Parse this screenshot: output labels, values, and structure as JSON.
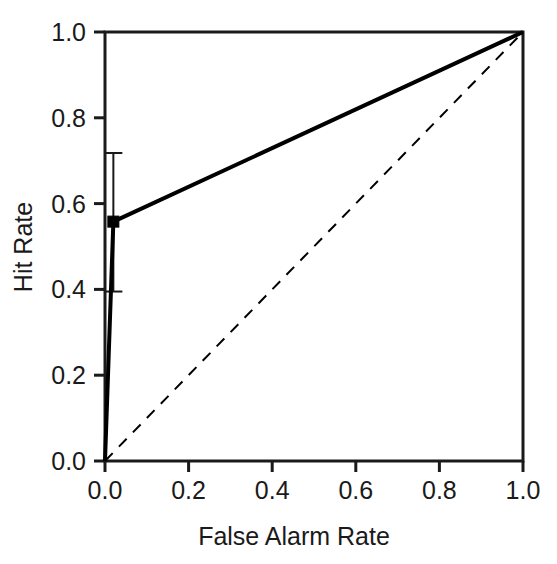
{
  "chart_data": {
    "type": "line",
    "title": "",
    "xlabel": "False Alarm Rate",
    "ylabel": "Hit Rate",
    "xlim": [
      0.0,
      1.0
    ],
    "ylim": [
      0.0,
      1.0
    ],
    "grid": false,
    "legend": "none",
    "xticks": [
      "0.0",
      "0.2",
      "0.4",
      "0.6",
      "0.8",
      "1.0"
    ],
    "xtick_values": [
      0.0,
      0.2,
      0.4,
      0.6,
      0.8,
      1.0
    ],
    "yticks": [
      "0.0",
      "0.2",
      "0.4",
      "0.6",
      "0.8",
      "1.0"
    ],
    "ytick_values": [
      0.0,
      0.2,
      0.4,
      0.6,
      0.8,
      1.0
    ],
    "series": [
      {
        "name": "ROC curve",
        "style": "solid",
        "linewidth": 4,
        "color": "#000000",
        "marker": "square",
        "x": [
          0.0,
          0.02,
          1.0
        ],
        "y": [
          0.0,
          0.558,
          1.0
        ],
        "marker_points": [
          {
            "x": 0.02,
            "y": 0.558
          }
        ],
        "error_bars": [
          {
            "x": 0.02,
            "y": 0.558,
            "lower": 0.395,
            "upper": 0.718
          }
        ]
      },
      {
        "name": "Chance diagonal",
        "style": "dashed",
        "linewidth": 2,
        "color": "#000000",
        "marker": "none",
        "x": [
          0.0,
          1.0
        ],
        "y": [
          0.0,
          1.0
        ]
      }
    ]
  },
  "axes": {
    "x_axis_label": "False Alarm Rate",
    "y_axis_label": "Hit Rate"
  }
}
